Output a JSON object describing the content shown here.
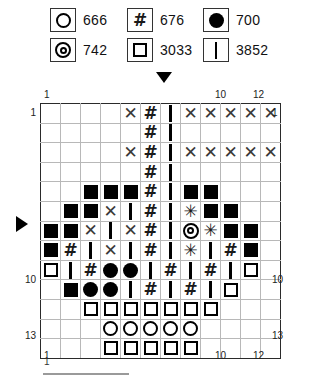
{
  "legend": {
    "items": [
      {
        "symbol": "open-circle",
        "glyph": "circle",
        "code": "666",
        "row": 0,
        "col": 0
      },
      {
        "symbol": "hash",
        "glyph": "hash",
        "code": "676",
        "row": 0,
        "col": 1
      },
      {
        "symbol": "filled-circle",
        "glyph": "dot",
        "code": "700",
        "row": 0,
        "col": 2
      },
      {
        "symbol": "double-circle",
        "glyph": "dbl",
        "code": "742",
        "row": 1,
        "col": 0
      },
      {
        "symbol": "open-square",
        "glyph": "square",
        "code": "3033",
        "row": 1,
        "col": 1
      },
      {
        "symbol": "vertical-bar",
        "glyph": "bar",
        "code": "3852",
        "row": 1,
        "col": 2
      }
    ]
  },
  "chart_data": {
    "type": "table",
    "title": "",
    "columns": 12,
    "rows": 13,
    "col_labels_top": {
      "1": 1,
      "10": 10,
      "12": 12
    },
    "col_labels_bottom": {
      "1": 1,
      "10": 10,
      "12": 12
    },
    "row_labels_left": {
      "1": 1,
      "10": 10,
      "13": 13
    },
    "row_labels_right": {
      "1": 1,
      "10": 10,
      "13": 13
    },
    "major_gridline_every": 5,
    "markers": {
      "top_arrow_column": 7,
      "left_arrow_row": 7
    },
    "symbol_key": {
      "X": "cross",
      "#": "hash",
      "I": "bar",
      "B": "filled-square",
      "O": "filled-circle",
      "C": "open-circle",
      "S": "open-square",
      "D": "double-circle",
      "A": "asterisk",
      ".": "empty"
    },
    "grid": [
      [
        ".",
        ".",
        ".",
        ".",
        "X",
        "#",
        "I",
        "X",
        "X",
        "X",
        "X",
        "X"
      ],
      [
        ".",
        ".",
        ".",
        ".",
        ".",
        "#",
        "I",
        ".",
        ".",
        ".",
        ".",
        "."
      ],
      [
        ".",
        ".",
        ".",
        ".",
        "X",
        "#",
        "I",
        "X",
        "X",
        "X",
        "X",
        "X"
      ],
      [
        ".",
        ".",
        ".",
        ".",
        ".",
        "#",
        "I",
        ".",
        ".",
        ".",
        ".",
        "."
      ],
      [
        ".",
        ".",
        "B",
        "B",
        "B",
        "#",
        "I",
        "B",
        "B",
        ".",
        ".",
        "."
      ],
      [
        ".",
        "B",
        "B",
        "X",
        "I",
        "#",
        "I",
        "A",
        "B",
        "B",
        ".",
        "."
      ],
      [
        "B",
        "B",
        "X",
        "I",
        "X",
        "#",
        "I",
        "D",
        "A",
        "B",
        "B",
        "."
      ],
      [
        "B",
        "#",
        "I",
        "X",
        "I",
        "#",
        "I",
        "A",
        "I",
        "#",
        "B",
        "."
      ],
      [
        "S",
        "I",
        "#",
        "O",
        "O",
        "I",
        "#",
        "I",
        "#",
        "I",
        "S",
        "."
      ],
      [
        ".",
        "B",
        "O",
        "O",
        "I",
        "#",
        "I",
        "#",
        "I",
        "S",
        ".",
        "."
      ],
      [
        ".",
        ".",
        "S",
        "S",
        "S",
        "S",
        "S",
        "S",
        "S",
        ".",
        ".",
        "."
      ],
      [
        ".",
        ".",
        ".",
        "C",
        "C",
        "C",
        "C",
        "C",
        ".",
        ".",
        ".",
        "."
      ],
      [
        ".",
        ".",
        ".",
        "S",
        "S",
        "S",
        "S",
        "S",
        ".",
        ".",
        ".",
        "."
      ]
    ]
  },
  "footer": {
    "scale_label": "1"
  }
}
